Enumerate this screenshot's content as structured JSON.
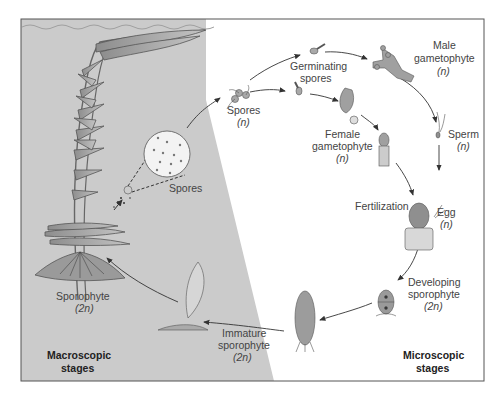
{
  "diagram": {
    "colors": {
      "macroscopic_bg": "#c9c9c9",
      "microscopic_bg": "#ffffff",
      "frame": "#555555",
      "water_line": "#999999",
      "arrow": "#333333",
      "plant_fill": "#b8b8b8",
      "plant_stroke": "#555555",
      "organism_fill": "#a9a9a9"
    },
    "regions": {
      "macroscopic": {
        "line1": "Macroscopic",
        "line2": "stages"
      },
      "microscopic": {
        "line1": "Microscopic",
        "line2": "stages"
      }
    },
    "labels": {
      "spores_inset": "Spores",
      "spores": {
        "line1": "Spores",
        "line2": "(n)"
      },
      "germinating_spores": {
        "line1": "Germinating",
        "line2": "spores"
      },
      "male_gametophyte": {
        "line1": "Male",
        "line2": "gametophyte",
        "line3": "(n)"
      },
      "female_gametophyte": {
        "line1": "Female",
        "line2": "gametophyte",
        "line3": "(n)"
      },
      "sperm": {
        "line1": "Sperm",
        "line2": "(n)"
      },
      "fertilization": "Fertilization",
      "egg": {
        "line1": "Egg",
        "line2": "(n)"
      },
      "developing_sporophyte": {
        "line1": "Developing",
        "line2": "sporophyte",
        "line3": "(2n)"
      },
      "immature_sporophyte": {
        "line1": "Immature",
        "line2": "sporophyte",
        "line3": "(2n)"
      },
      "sporophyte": {
        "line1": "Sporophyte",
        "line2": "(2n)"
      }
    },
    "cycle_order": [
      "Sporophyte (2n)",
      "Spores (n)",
      "Germinating spores",
      "Male gametophyte (n)",
      "Female gametophyte (n)",
      "Sperm (n)",
      "Egg (n)",
      "Fertilization",
      "Developing sporophyte (2n)",
      "Immature sporophyte (2n)"
    ]
  }
}
